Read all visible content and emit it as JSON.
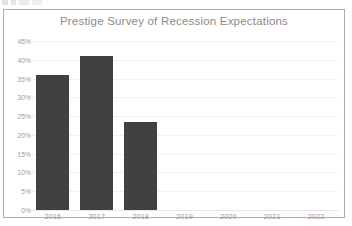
{
  "chart_data": {
    "type": "bar",
    "title": "Prestige Survey of Recession Expectations",
    "xlabel": "",
    "ylabel": "",
    "categories": [
      "2016",
      "2017",
      "2018",
      "2019",
      "2020",
      "2021",
      "2022"
    ],
    "values": [
      36,
      41,
      23.5,
      null,
      null,
      null,
      null
    ],
    "value_labels": [
      "36%",
      "41%",
      "23.5%",
      "",
      "",
      "",
      ""
    ],
    "ytick_labels": [
      "0%",
      "5%",
      "10%",
      "15%",
      "20%",
      "25%",
      "30%",
      "35%",
      "40%",
      "45%"
    ],
    "ytick_values": [
      0,
      5,
      10,
      15,
      20,
      25,
      30,
      35,
      40,
      45
    ],
    "ylim": [
      0,
      45
    ],
    "grid": true,
    "legend": "none",
    "bar_color": "#414141",
    "title_color": "#8a8a8a",
    "tick_color": "#9a9a9a",
    "gridline_color": "#f1f1f1",
    "frame_color": "#adadad",
    "background_color": "#ffffff"
  }
}
